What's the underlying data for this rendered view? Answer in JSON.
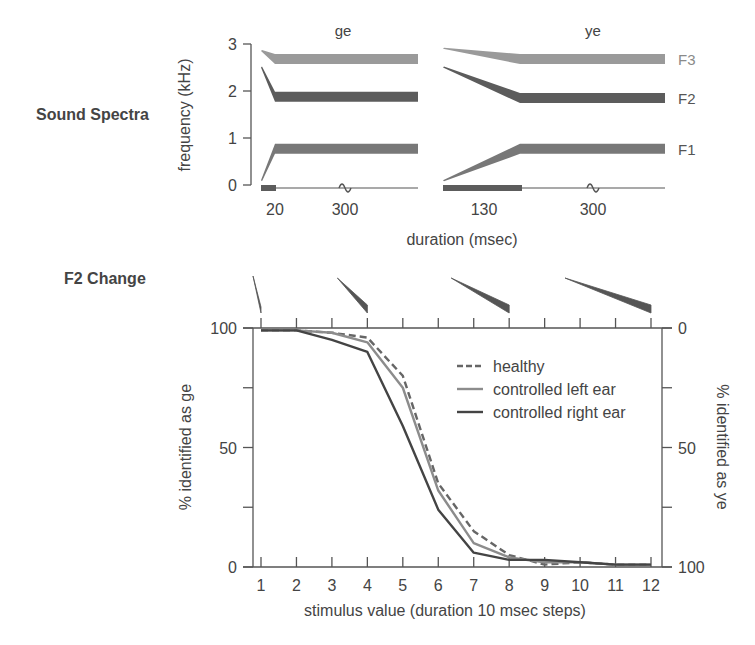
{
  "section_labels": {
    "top": "Sound Spectra",
    "bottom": "F2 Change"
  },
  "chart_data": [
    {
      "type": "area",
      "title": "Sound Spectra",
      "panels": [
        {
          "name": "ge",
          "transition_ms": 20,
          "steady_label": "300",
          "transition_label": "20",
          "formants": [
            {
              "name": "F3",
              "start_khz": 2.85,
              "steady_khz": 2.68,
              "color": "#9a9a9a"
            },
            {
              "name": "F2",
              "start_khz": 2.5,
              "steady_khz": 1.88,
              "color": "#5c5c5c"
            },
            {
              "name": "F1",
              "start_khz": 0.1,
              "steady_khz": 0.77,
              "color": "#787878"
            }
          ]
        },
        {
          "name": "ye",
          "transition_ms": 130,
          "steady_label": "300",
          "transition_label": "130",
          "formants": [
            {
              "name": "F3",
              "start_khz": 2.9,
              "steady_khz": 2.68,
              "color": "#9a9a9a"
            },
            {
              "name": "F2",
              "start_khz": 2.5,
              "steady_khz": 1.85,
              "color": "#5c5c5c"
            },
            {
              "name": "F1",
              "start_khz": 0.1,
              "steady_khz": 0.77,
              "color": "#787878"
            }
          ]
        }
      ],
      "ylabel": "frequency (kHz)",
      "xlabel": "duration (msec)",
      "yticks": [
        0,
        1,
        2,
        3
      ],
      "ylim": [
        0,
        3
      ],
      "formant_labels": [
        "F3",
        "F2",
        "F1"
      ]
    },
    {
      "type": "line",
      "title": "F2 Change",
      "x": [
        1,
        2,
        3,
        4,
        5,
        6,
        7,
        8,
        9,
        10,
        11,
        12
      ],
      "xticks": [
        "1",
        "2",
        "3",
        "4",
        "5",
        "6",
        "7",
        "8",
        "9",
        "10",
        "11",
        "12"
      ],
      "series": [
        {
          "name": "healthy",
          "style": "dashed",
          "color": "#666666",
          "values": [
            99,
            99,
            98,
            96,
            80,
            35,
            15,
            5,
            1,
            2,
            1,
            1
          ]
        },
        {
          "name": "controlled left ear",
          "style": "solid",
          "color": "#8c8c8c",
          "values": [
            99,
            99,
            98,
            94,
            75,
            32,
            10,
            4,
            2,
            2,
            1,
            1
          ]
        },
        {
          "name": "controlled right ear",
          "style": "solid",
          "color": "#444444",
          "values": [
            99,
            99,
            95,
            90,
            59,
            24,
            6,
            3,
            3,
            2,
            1,
            1
          ]
        }
      ],
      "xlabel": "stimulus value  (duration 10 msec steps)",
      "ylabel_left": "% identified  as  ge",
      "ylabel_right": "% identified  as  ye",
      "yticks_left": [
        "0",
        "50",
        "100"
      ],
      "yticks_right": [
        "100",
        "50",
        "0"
      ],
      "ylim": [
        0,
        100
      ],
      "legend_position": "upper right",
      "f2_glyph_stimuli": [
        1,
        4,
        8,
        12
      ]
    }
  ]
}
